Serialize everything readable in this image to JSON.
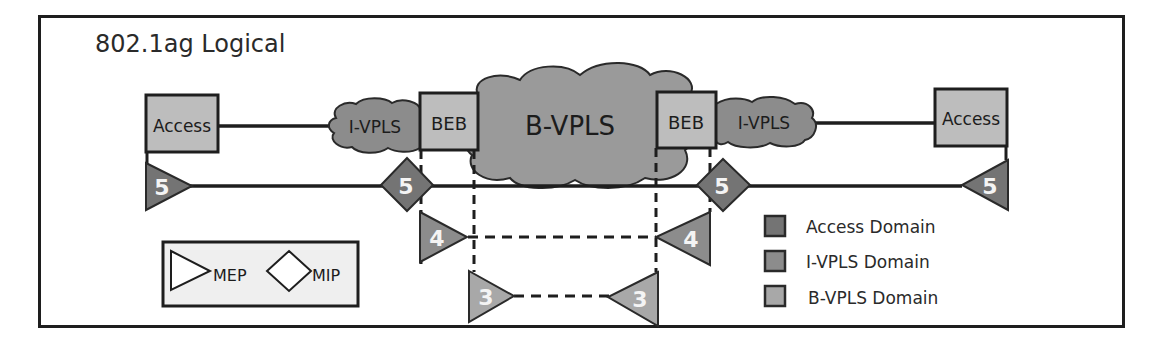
{
  "diagram": {
    "title": "802.1ag Logical",
    "nodes": {
      "access_left": "Access",
      "access_right": "Access",
      "beb_left": "BEB",
      "beb_right": "BEB",
      "ivpls_left": "I-VPLS",
      "ivpls_right": "I-VPLS",
      "bvpls": "B-VPLS"
    },
    "levels": {
      "mep_left_5": "5",
      "mip_left_5": "5",
      "mip_right_5": "5",
      "mep_right_5": "5",
      "mep_left_4": "4",
      "mep_right_4": "4",
      "mep_left_3": "3",
      "mep_right_3": "3"
    },
    "shape_key": {
      "mep_label": "MEP",
      "mip_label": "MIP"
    },
    "legend": [
      {
        "label": "Access Domain",
        "color": "#747474"
      },
      {
        "label": "I-VPLS Domain",
        "color": "#8c8c8c"
      },
      {
        "label": "B-VPLS Domain",
        "color": "#a8a8a8"
      }
    ],
    "colors": {
      "access_domain": "#747474",
      "ivpls_domain": "#8c8c8c",
      "bvpls_domain": "#a8a8a8",
      "box_fill": "#bdbdbd",
      "cloud_fill": "#9a9a9a",
      "stroke": "#1e1e1e"
    }
  }
}
